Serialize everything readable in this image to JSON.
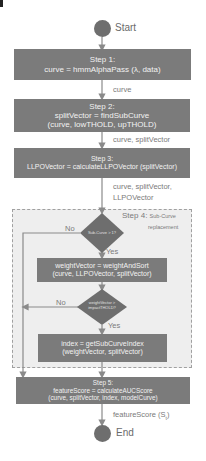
{
  "diagram": {
    "start_label": "Start",
    "end_label": "End",
    "steps": [
      {
        "title": "Step 1:",
        "lines": [
          "curve = hmmAlphaPass (λ, data)"
        ]
      },
      {
        "title": "Step 2:",
        "lines": [
          "splitVector = findSubCurve",
          "(curve, lowTHOLD, upTHOLD)"
        ]
      },
      {
        "title": "Step 3:",
        "lines": [
          "LLPOVector = calculateLLPOVector (splitVector)"
        ]
      },
      {
        "title": "Step 5:",
        "lines": [
          "featureScore = calculateAUCScore",
          "(curve, splitVector, index, modelCurve)"
        ]
      }
    ],
    "step4": {
      "title": "Step 4:",
      "subtitle_line1": "Sub-Curve",
      "subtitle_line2": "replacement",
      "decision1": "Sub-Curve > 1?",
      "decision2_line1": "weightVector >",
      "decision2_line2": "impactTHOLD?",
      "process1": [
        "weightVector = weightAndSort",
        "(curve, LLPOVector, splitVector)"
      ],
      "process2": [
        "index = getSubCurveIndex",
        "(weightVector, splitVector)"
      ],
      "yes_label": "Yes",
      "no_label": "No"
    },
    "edges": {
      "e1": "curve",
      "e2": "curve, splitVector",
      "e3_line1": "curve, splitVector,",
      "e3_line2": "LLPOVector",
      "e5": "featureScore (S"
    },
    "edge5_subscript": "t",
    "edge5_close": ")",
    "colors": {
      "box": "#7b7b7b",
      "text_on_box": "#f2f2f2",
      "arrow": "#8a8a8a",
      "dashed_bg": "#eeeeee"
    }
  }
}
